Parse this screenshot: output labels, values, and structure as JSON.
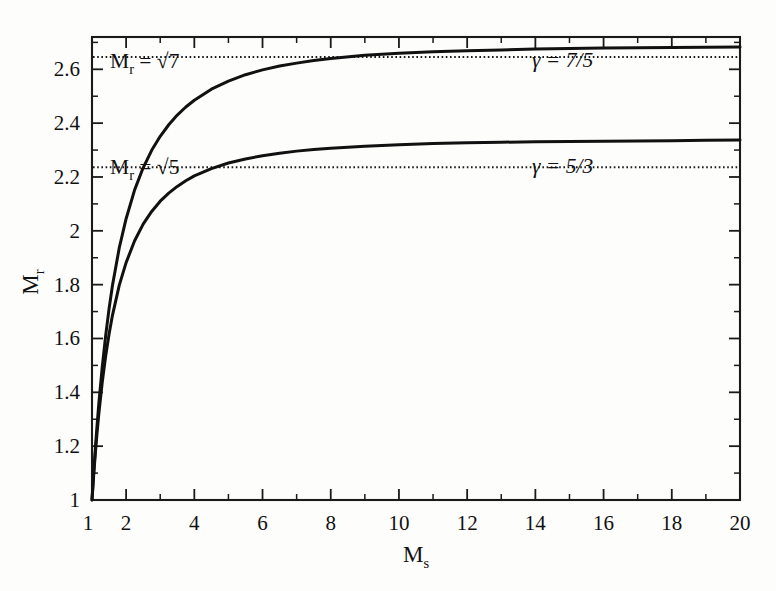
{
  "figure": {
    "background_color": "#fdfdfc",
    "line_color": "#111111",
    "axis_color": "#1a1a1a"
  },
  "axes": {
    "y_label_main": "M",
    "y_label_sub": "r",
    "x_label_main": "M",
    "x_label_sub": "s"
  },
  "annotations": {
    "sqrt7_label_main": "M",
    "sqrt7_label_sub": "r",
    "sqrt7_label_eq": " = √7",
    "sqrt5_label_main": "M",
    "sqrt5_label_sub": "r",
    "sqrt5_label_eq": " = √5",
    "gamma_75": "γ = 7/5",
    "gamma_53": "γ = 5/3"
  },
  "chart_data": {
    "type": "line",
    "title": "",
    "xlabel": "M_s",
    "ylabel": "M_r",
    "xlim": [
      1,
      20
    ],
    "ylim": [
      1,
      2.72
    ],
    "grid": false,
    "legend": "none",
    "x_ticks_major": [
      2,
      4,
      6,
      8,
      10,
      12,
      14,
      16,
      18,
      20
    ],
    "x_ticks_major_labels": [
      "2",
      "4",
      "6",
      "8",
      "10",
      "12",
      "14",
      "16",
      "18",
      "20"
    ],
    "x_origin_label": "1",
    "x_ticks_minor": [
      3,
      5,
      7,
      9,
      11,
      13,
      15,
      17,
      19
    ],
    "y_ticks_major": [
      1,
      1.2,
      1.4,
      1.6,
      1.8,
      2,
      2.2,
      2.4,
      2.6
    ],
    "y_ticks_major_labels": [
      "1",
      "1.2",
      "1.4",
      "1.6",
      "1.8",
      "2",
      "2.2",
      "2.4",
      "2.6"
    ],
    "y_ticks_minor": [
      1.1,
      1.3,
      1.5,
      1.7,
      1.9,
      2.1,
      2.3,
      2.5,
      2.7
    ],
    "asymptotes": [
      {
        "name": "M_r = sqrt(7)",
        "value": 2.6458,
        "style": "dotted",
        "label": "M_r = √7",
        "gamma": "γ = 7/5"
      },
      {
        "name": "M_r = sqrt(5)",
        "value": 2.2361,
        "style": "dotted",
        "label": "M_r = √5",
        "gamma": "γ = 5/3"
      }
    ],
    "series": [
      {
        "name": "gamma = 7/5",
        "gamma": 1.4,
        "asymptote": 2.6458,
        "x": [
          1,
          1.05,
          1.1,
          1.15,
          1.2,
          1.3,
          1.4,
          1.5,
          1.6,
          1.8,
          2,
          2.25,
          2.5,
          2.75,
          3,
          3.25,
          3.5,
          3.75,
          4,
          4.5,
          5,
          5.5,
          6,
          6.5,
          7,
          7.5,
          8,
          9,
          10,
          11,
          12,
          13,
          14,
          15,
          16,
          17,
          18,
          19,
          20
        ],
        "y": [
          1,
          1.103,
          1.195,
          1.28,
          1.358,
          1.494,
          1.61,
          1.71,
          1.797,
          1.937,
          2.045,
          2.152,
          2.234,
          2.299,
          2.351,
          2.394,
          2.43,
          2.46,
          2.485,
          2.526,
          2.556,
          2.58,
          2.598,
          2.612,
          2.623,
          2.633,
          2.64,
          2.652,
          2.66,
          2.665,
          2.669,
          2.672,
          2.675,
          2.677,
          2.679,
          2.68,
          2.681,
          2.682,
          2.683
        ]
      },
      {
        "name": "gamma = 5/3",
        "gamma": 1.6667,
        "asymptote": 2.2361,
        "x": [
          1,
          1.05,
          1.1,
          1.15,
          1.2,
          1.3,
          1.4,
          1.5,
          1.6,
          1.8,
          2,
          2.25,
          2.5,
          2.75,
          3,
          3.25,
          3.5,
          3.75,
          4,
          4.5,
          5,
          5.5,
          6,
          6.5,
          7,
          7.5,
          8,
          9,
          10,
          11,
          12,
          13,
          14,
          15,
          16,
          17,
          18,
          19,
          20
        ],
        "y": [
          1,
          1.094,
          1.177,
          1.252,
          1.32,
          1.437,
          1.534,
          1.616,
          1.686,
          1.798,
          1.882,
          1.963,
          2.025,
          2.072,
          2.11,
          2.14,
          2.165,
          2.186,
          2.204,
          2.231,
          2.252,
          2.267,
          2.279,
          2.288,
          2.296,
          2.302,
          2.307,
          2.314,
          2.32,
          2.324,
          2.327,
          2.329,
          2.331,
          2.332,
          2.333,
          2.334,
          2.335,
          2.336,
          2.337
        ]
      }
    ]
  }
}
